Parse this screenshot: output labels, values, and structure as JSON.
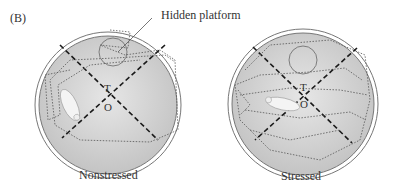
{
  "figure": {
    "panel_label": "(B)",
    "callout_label": "Hidden platform",
    "pools": [
      {
        "id": "nonstressed",
        "caption": "Nonstressed",
        "marker_t": "T",
        "marker_o": "O"
      },
      {
        "id": "stressed",
        "caption": "Stressed",
        "marker_t": "T",
        "marker_o": "O"
      }
    ],
    "colors": {
      "pool_fill": "#d4d4d4",
      "pool_rim": "#888888",
      "path": "#555555",
      "dashed_axes": "#1a1a1a"
    }
  }
}
